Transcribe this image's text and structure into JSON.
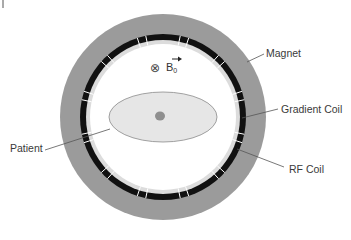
{
  "labels": {
    "magnet": "Magnet",
    "gradient_coil": "Gradient Coil",
    "rf_coil": "RF Coil",
    "patient": "Patient"
  },
  "field": {
    "symbol": "⊗",
    "name": "B",
    "subscript": "0"
  },
  "colors": {
    "magnet": "#9b9b9b",
    "gradient_coil": "#111111",
    "rf_coil": "#dcdcdc",
    "bore": "#ffffff",
    "patient_body": "#e6e6e6",
    "patient_core": "#8f8f8f",
    "leader_line": "#555555"
  },
  "geometry": {
    "center": [
      163,
      117
    ],
    "magnet_outer_radius": 103,
    "gradient_outer_radius": 83,
    "gradient_inner_radius": 77,
    "rf_inner_radius": 73,
    "patient_rx": 54,
    "patient_ry": 25
  }
}
